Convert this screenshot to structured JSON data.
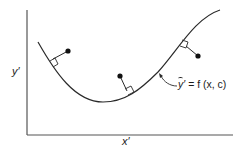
{
  "diagram": {
    "title": "",
    "axes": {
      "x_label": "x′",
      "y_label": "y′"
    },
    "curve": {
      "label_var": "y",
      "label_prime": "′",
      "label_rest": " = f (x, c)",
      "label_full": "ỹ′ = f (x, c)"
    },
    "data_points": [
      {
        "id": 1,
        "x": 68,
        "y": 51,
        "foot_x": 53,
        "foot_y": 63
      },
      {
        "id": 2,
        "x": 120,
        "y": 76,
        "foot_x": 128,
        "foot_y": 94
      },
      {
        "id": 3,
        "x": 198,
        "y": 56,
        "foot_x": 184,
        "foot_y": 42
      }
    ],
    "colors": {
      "stroke": "#2a2a2a",
      "axis": "#555555",
      "background": "#ffffff"
    }
  }
}
